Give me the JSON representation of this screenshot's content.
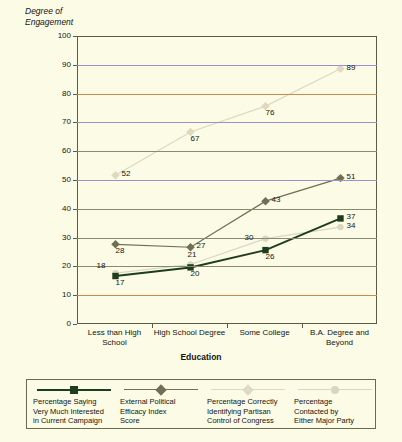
{
  "chart_data": {
    "type": "line",
    "title": "",
    "ylabel": "Degree of\nEngagement",
    "xlabel": "Education",
    "categories": [
      "Less than High\nSchool",
      "High School Degree",
      "Some College",
      "B.A. Degree and\nBeyond"
    ],
    "ylim": [
      0,
      100
    ],
    "ytick_labels": [
      "0",
      "10",
      "20",
      "30",
      "40",
      "50",
      "60",
      "70",
      "80",
      "90",
      "100"
    ],
    "ytick_values": [
      0,
      10,
      20,
      30,
      40,
      50,
      60,
      70,
      80,
      90,
      100
    ],
    "grid": true,
    "legend_position": "bottom",
    "series": [
      {
        "name": "Percentage Saying\nVery Much Interested\nin Current Campaign",
        "values": [
          17,
          20,
          26,
          37
        ],
        "color": "#1e3c1e",
        "marker": "square",
        "label_positions": [
          "below",
          "below",
          "below",
          "right"
        ]
      },
      {
        "name": "External Political\nEfficacy Index\nScore",
        "values": [
          28,
          27,
          43,
          51
        ],
        "color": "#6e7051",
        "marker": "diamond",
        "label_positions": [
          "below",
          "right",
          "right",
          "right"
        ]
      },
      {
        "name": "Percentage Correctly\nIdentifying Partisan\nControl of Congress",
        "values": [
          52,
          67,
          76,
          89
        ],
        "color": "#ded9c0",
        "marker": "diamond",
        "label_positions": [
          "right",
          "below",
          "below",
          "right"
        ]
      },
      {
        "name": "Percentage\nContacted by\nEither Major Party",
        "values": [
          18,
          21,
          30,
          34
        ],
        "color": "#d9d6c2",
        "marker": "circle",
        "label_positions": [
          "above-left",
          "above",
          "left",
          "right"
        ]
      }
    ],
    "extra_point_labels": [
      {
        "series": 0,
        "index": 0,
        "text": "17"
      },
      {
        "series": 0,
        "index": 1,
        "text": "20"
      },
      {
        "series": 0,
        "index": 2,
        "text": "26"
      },
      {
        "series": 0,
        "index": 3,
        "text": "37"
      },
      {
        "series": 1,
        "index": 0,
        "text": "28"
      },
      {
        "series": 1,
        "index": 1,
        "text": "27"
      },
      {
        "series": 1,
        "index": 2,
        "text": "43"
      },
      {
        "series": 1,
        "index": 3,
        "text": "51"
      },
      {
        "series": 2,
        "index": 0,
        "text": "52"
      },
      {
        "series": 2,
        "index": 1,
        "text": "67"
      },
      {
        "series": 2,
        "index": 2,
        "text": "76"
      },
      {
        "series": 2,
        "index": 3,
        "text": "89"
      },
      {
        "series": 3,
        "index": 0,
        "text": "18"
      },
      {
        "series": 3,
        "index": 1,
        "text": "21"
      },
      {
        "series": 3,
        "index": 2,
        "text": "30"
      },
      {
        "series": 3,
        "index": 3,
        "text": "34"
      }
    ]
  },
  "colors": {
    "background": "#fbfbe6",
    "axis": "#5b5b46",
    "text": "#15150f",
    "grid_default": "#8a8a6e",
    "grid_purple": "#9a8fd0",
    "grid_orange": "#c98a4b"
  }
}
